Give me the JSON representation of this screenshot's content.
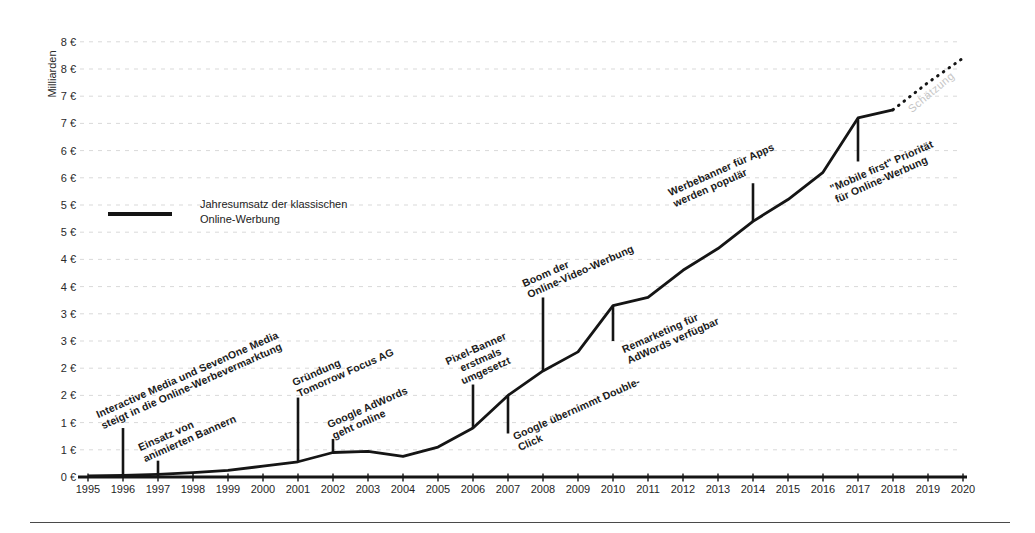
{
  "chart_data": {
    "type": "line",
    "title": "",
    "y_axis": {
      "title": "Milliarden",
      "range": [
        0,
        8
      ],
      "tick_step": 0.5,
      "tick_values": [
        0,
        0.5,
        1,
        1.5,
        2,
        2.5,
        3,
        3.5,
        4,
        4.5,
        5,
        5.5,
        6,
        6.5,
        7,
        7.5,
        8
      ],
      "tick_labels": [
        "0 €",
        "1 €",
        "1 €",
        "2 €",
        "2 €",
        "3 €",
        "3 €",
        "4 €",
        "4 €",
        "5 €",
        "5 €",
        "6 €",
        "6 €",
        "7 €",
        "7 €",
        "8 €",
        "8 €"
      ],
      "grid": "dashed"
    },
    "x_axis": {
      "range": [
        1995,
        2020
      ],
      "tick_labels": [
        "1995",
        "1996",
        "1997",
        "1998",
        "1999",
        "2000",
        "2001",
        "2002",
        "2003",
        "2004",
        "2005",
        "2006",
        "2007",
        "2008",
        "2009",
        "2010",
        "2011",
        "2012",
        "2013",
        "2014",
        "2015",
        "2016",
        "2017",
        "2018",
        "2019",
        "2020"
      ]
    },
    "legend": {
      "label": "Jahresumsatz der klassischen\nOnline-Werbung",
      "series_color": "#151515",
      "position": "inside-left"
    },
    "series": [
      {
        "name": "Jahresumsatz der klassischen Online-Werbung",
        "style": "solid",
        "color": "#151515",
        "x": [
          1995,
          1996,
          1997,
          1998,
          1999,
          2000,
          2001,
          2002,
          2003,
          2004,
          2005,
          2006,
          2007,
          2008,
          2009,
          2010,
          2011,
          2012,
          2013,
          2014,
          2015,
          2016,
          2017,
          2018
        ],
        "values": [
          0.02,
          0.03,
          0.05,
          0.08,
          0.12,
          0.2,
          0.28,
          0.45,
          0.47,
          0.38,
          0.55,
          0.9,
          1.5,
          1.95,
          2.3,
          3.15,
          3.3,
          3.8,
          4.2,
          4.7,
          5.1,
          5.6,
          6.6,
          6.75
        ]
      },
      {
        "name": "Schätzung (Prognose)",
        "style": "dotted",
        "color": "#151515",
        "label": "Schätzung",
        "label_color": "#c6c6c6",
        "x": [
          2018,
          2019,
          2020
        ],
        "values": [
          6.75,
          7.25,
          7.7
        ]
      }
    ],
    "annotations": [
      {
        "year": 1996,
        "text": "Interactive Media und SevenOne Media\nsteigt in die Online-Werbevermarktung",
        "line_from": 0,
        "line_to": 0.9
      },
      {
        "year": 1997,
        "text": "Einsatz von\nanimierten Bannern",
        "line_from": 0,
        "line_to": 0.3
      },
      {
        "year": 2001,
        "text": "Gründung\nTomorrow Focus AG",
        "line_from": 0.28,
        "line_to": 1.46
      },
      {
        "year": 2002,
        "text": "Google AdWords\ngeht online",
        "line_from": 0.45,
        "line_to": 0.7
      },
      {
        "year": 2006,
        "text": "Pixel-Banner\nerstmals\numgesetzt",
        "line_from": 0.9,
        "line_to": 1.7
      },
      {
        "year": 2007,
        "text": "Google übernimmt Double-\nClick",
        "line_from": 1.5,
        "line_to": 0.8
      },
      {
        "year": 2008,
        "text": "Boom der\nOnline-Video-Werbung",
        "line_from": 1.95,
        "line_to": 3.3
      },
      {
        "year": 2010,
        "text": "Remarketing für\nAdWords verfügbar",
        "line_from": 3.15,
        "line_to": 2.5
      },
      {
        "year": 2014,
        "text": "Werbebanner für Apps\nwerden populär",
        "line_from": 4.7,
        "line_to": 5.4
      },
      {
        "year": 2017,
        "text": "\"Mobile first\" Priorität\nfür Online-Werbung",
        "line_from": 6.6,
        "line_to": 5.8
      }
    ]
  }
}
